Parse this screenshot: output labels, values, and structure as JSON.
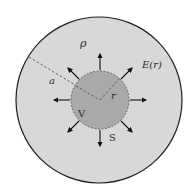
{
  "diagram": {
    "colors": {
      "background": "#ffffff",
      "outer_fill": "#d8d8d8",
      "outer_stroke": "#1e1e1e",
      "inner_fill": "#a9a9a9",
      "inner_stroke": "#555555",
      "arrow": "#111111",
      "dash": "#555555"
    },
    "outer_sphere": {
      "cx": 99,
      "cy": 100,
      "r": 83
    },
    "inner_sphere": {
      "cx": 100,
      "cy": 100,
      "r": 29
    },
    "labels": {
      "rho": "ρ",
      "field": "E(r)",
      "radius_outer": "a",
      "radius_inner": "r",
      "volume": "V",
      "surface": "S"
    },
    "arrow_count": 8
  }
}
